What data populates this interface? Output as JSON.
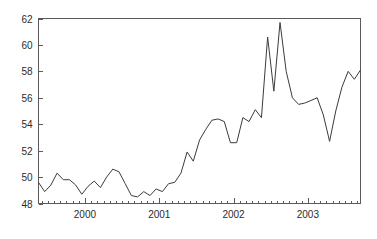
{
  "chart_data": {
    "type": "line",
    "title": "",
    "subtitle": "",
    "xlabel": "",
    "ylabel": "",
    "ylim": [
      48,
      62
    ],
    "xlim": [
      1999.375,
      2003.708
    ],
    "ytick_labels": [
      "48",
      "50",
      "52",
      "54",
      "56",
      "58",
      "60",
      "62"
    ],
    "ytick_values": [
      48,
      50,
      52,
      54,
      56,
      58,
      60,
      62
    ],
    "xtick_labels": [
      "2000",
      "2001",
      "2002",
      "2003"
    ],
    "xtick_values": [
      2000,
      2001,
      2002,
      2003
    ],
    "minor_xticks_per_year": 12,
    "grid": false,
    "legend": null,
    "legend_position": "none",
    "frame": "box",
    "series": [
      {
        "name": "series-1",
        "color": "#3b3b3b",
        "x": [
          1999.375,
          1999.458,
          1999.542,
          1999.625,
          1999.708,
          1999.792,
          1999.875,
          1999.958,
          2000.042,
          2000.125,
          2000.208,
          2000.292,
          2000.375,
          2000.458,
          2000.542,
          2000.625,
          2000.708,
          2000.792,
          2000.875,
          2000.958,
          2001.042,
          2001.125,
          2001.208,
          2001.292,
          2001.375,
          2001.458,
          2001.542,
          2001.625,
          2001.708,
          2001.792,
          2001.875,
          2001.958,
          2002.042,
          2002.125,
          2002.208,
          2002.292,
          2002.375,
          2002.458,
          2002.542,
          2002.625,
          2002.708,
          2002.792,
          2002.875,
          2002.958,
          2003.042,
          2003.125,
          2003.208,
          2003.292,
          2003.375,
          2003.458,
          2003.542,
          2003.625,
          2003.708
        ],
        "y": [
          49.6,
          48.9,
          49.4,
          50.3,
          49.8,
          49.8,
          49.4,
          48.7,
          49.3,
          49.7,
          49.2,
          50.0,
          50.6,
          50.4,
          49.5,
          48.6,
          48.5,
          48.9,
          48.6,
          49.1,
          48.9,
          49.5,
          49.6,
          50.3,
          51.9,
          51.2,
          52.8,
          53.6,
          54.3,
          54.4,
          54.2,
          52.6,
          52.6,
          54.5,
          54.2,
          55.1,
          54.5,
          60.6,
          56.5,
          61.7,
          58.0,
          56.0,
          55.5,
          55.6,
          55.8,
          56.0,
          54.7,
          52.7,
          55.0,
          56.8,
          58.0,
          57.4,
          58.1
        ]
      }
    ]
  }
}
